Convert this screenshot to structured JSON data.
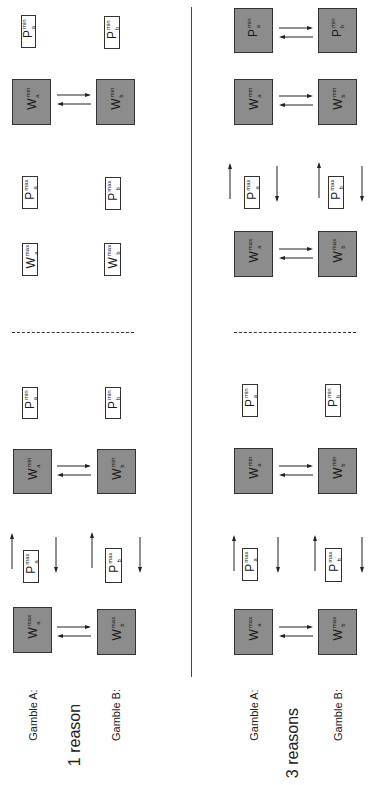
{
  "figure": {
    "orientation": "rotated 90deg counter-clockwise",
    "colors": {
      "filled_box": "#8c8c8c",
      "outline": "#333333",
      "background": "#ffffff"
    },
    "panels": [
      {
        "title": "1 reason",
        "row_labels": {
          "gamble_a": "Gamble A:",
          "gamble_b": "Gamble B:"
        },
        "sections": [
          {
            "name": "left-section",
            "items": [
              {
                "symbol": "W",
                "sup": "max",
                "sub_a": "a",
                "sub_b": "b",
                "style": "filled",
                "link_arrows": true
              },
              {
                "symbol": "P",
                "sup": "max",
                "sub_a": "a",
                "sub_b": "b",
                "style": "outline",
                "updown_arrows": true
              },
              {
                "symbol": "W",
                "sup": "min",
                "sub_a": "a",
                "sub_b": "b",
                "style": "filled",
                "link_arrows": true
              },
              {
                "symbol": "P",
                "sup": "min",
                "sub_a": "a",
                "sub_b": "b",
                "style": "outline"
              }
            ]
          },
          {
            "name": "right-section",
            "items": [
              {
                "symbol": "W",
                "sup": "max",
                "sub_a": "a",
                "sub_b": "b",
                "style": "outline"
              },
              {
                "symbol": "P",
                "sup": "max",
                "sub_a": "a",
                "sub_b": "b",
                "style": "outline"
              },
              {
                "symbol": "W",
                "sup": "min",
                "sub_a": "a",
                "sub_b": "b",
                "style": "filled",
                "link_arrows": true
              },
              {
                "symbol": "P",
                "sup": "min",
                "sub_a": "a",
                "sub_b": "b",
                "style": "outline"
              }
            ]
          }
        ]
      },
      {
        "title": "3 reasons",
        "row_labels": {
          "gamble_a": "Gamble A:",
          "gamble_b": "Gamble B:"
        },
        "sections": [
          {
            "name": "left-section",
            "items": [
              {
                "symbol": "W",
                "sup": "max",
                "sub_a": "a",
                "sub_b": "b",
                "style": "filled",
                "link_arrows": true
              },
              {
                "symbol": "P",
                "sup": "max",
                "sub_a": "a",
                "sub_b": "b",
                "style": "outline",
                "updown_arrows": true
              },
              {
                "symbol": "W",
                "sup": "min",
                "sub_a": "a",
                "sub_b": "b",
                "style": "filled",
                "link_arrows": true
              },
              {
                "symbol": "P",
                "sup": "min",
                "sub_a": "a",
                "sub_b": "b",
                "style": "outline"
              }
            ]
          },
          {
            "name": "right-section",
            "items": [
              {
                "symbol": "W",
                "sup": "max",
                "sub_a": "a",
                "sub_b": "b",
                "style": "filled",
                "link_arrows": true
              },
              {
                "symbol": "P",
                "sup": "max",
                "sub_a": "a",
                "sub_b": "b",
                "style": "outline",
                "updown_arrows": true
              },
              {
                "symbol": "W",
                "sup": "min",
                "sub_a": "a",
                "sub_b": "b",
                "style": "filled",
                "link_arrows": true
              },
              {
                "symbol": "P",
                "sup": "min",
                "sub_a": "a",
                "sub_b": "b",
                "style": "outline",
                "filled_override": true
              }
            ]
          }
        ]
      }
    ],
    "text": {
      "p1_title": "1 reason",
      "p2_title": "3 reasons",
      "gamble_a": "Gamble A:",
      "gamble_b": "Gamble B:",
      "W": "W",
      "P": "P",
      "max": "max",
      "min": "min",
      "a": "a",
      "b": "b"
    }
  }
}
